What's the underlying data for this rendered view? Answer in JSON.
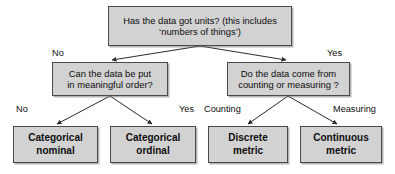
{
  "diagram": {
    "type": "decision-tree",
    "colors": {
      "node_fill": "#d2d2d2",
      "node_border": "#4a4a4a",
      "text": "#0d0d0d",
      "background": "#ffffff",
      "edge": "#2b2b2b"
    },
    "nodes": {
      "root": {
        "id": "root",
        "kind": "question",
        "text": "Has the data got units? (this includes\n‘numbers of things’)"
      },
      "order": {
        "id": "order",
        "kind": "question",
        "text": "Can the data be put\nin meaningful order?"
      },
      "source": {
        "id": "source",
        "kind": "question",
        "text": "Do the data come from\ncounting or measuring ?"
      },
      "categorical_nominal": {
        "id": "categorical_nominal",
        "kind": "result",
        "text": "Categorical\nnominal"
      },
      "categorical_ordinal": {
        "id": "categorical_ordinal",
        "kind": "result",
        "text": "Categorical\nordinal"
      },
      "discrete_metric": {
        "id": "discrete_metric",
        "kind": "result",
        "text": "Discrete\nmetric"
      },
      "continuous_metric": {
        "id": "continuous_metric",
        "kind": "result",
        "text": "Continuous\nmetric"
      }
    },
    "edges": [
      {
        "id": "root-no",
        "from": "root",
        "to": "order",
        "label": "No"
      },
      {
        "id": "root-yes",
        "from": "root",
        "to": "source",
        "label": "Yes"
      },
      {
        "id": "order-no",
        "from": "order",
        "to": "categorical_nominal",
        "label": "No"
      },
      {
        "id": "order-yes",
        "from": "order",
        "to": "categorical_ordinal",
        "label": "Yes"
      },
      {
        "id": "source-counting",
        "from": "source",
        "to": "discrete_metric",
        "label": "Counting"
      },
      {
        "id": "source-measuring",
        "from": "source",
        "to": "continuous_metric",
        "label": "Measuring"
      }
    ]
  }
}
